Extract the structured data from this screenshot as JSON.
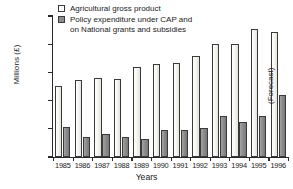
{
  "chart_data": {
    "type": "bar",
    "title": "",
    "subtitle": "",
    "xlabel": "Years",
    "ylabel": "Millions (£)",
    "ylim": [
      0,
      10000
    ],
    "ytick_values": [
      0,
      2000,
      4000,
      6000,
      8000,
      10000
    ],
    "ytick_labels": [
      "0",
      "2,000",
      "4,000",
      "6,000",
      "8,000",
      "10,000"
    ],
    "grid": false,
    "legend_position": "top-left",
    "categories": [
      "1985",
      "1986",
      "1987",
      "1988",
      "1989",
      "1990",
      "1991",
      "1992",
      "1993",
      "1994",
      "1995",
      "1996"
    ],
    "series": [
      {
        "name": "Agricultural gross product",
        "color": "#f5f4f0",
        "values": [
          5050,
          5450,
          5600,
          5500,
          6400,
          6600,
          6650,
          7150,
          8000,
          8050,
          9100,
          8900
        ]
      },
      {
        "name": "Policy expenditure under CAP and\non National grants and subsidies",
        "color": "#8d8d8d",
        "values": [
          2150,
          1450,
          1650,
          1400,
          1250,
          1900,
          1950,
          2050,
          2900,
          2500,
          2900,
          4400
        ]
      }
    ],
    "annotations": [
      {
        "text": "(Forecast)",
        "target_category": "1996",
        "orientation": "vertical"
      }
    ]
  },
  "legend": {
    "items": [
      {
        "label": "Agricultural gross product",
        "swatch": "light"
      },
      {
        "label": "Policy expenditure under CAP and\non National grants and subsidies",
        "swatch": "dark"
      }
    ]
  },
  "annotations": {
    "forecast": "(Forecast)"
  },
  "axes": {
    "x_title": "Years",
    "y_title": "Millions (£)"
  }
}
